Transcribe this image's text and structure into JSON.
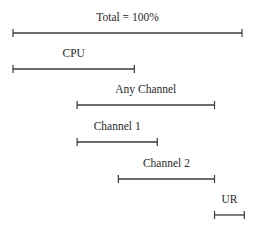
{
  "diagram": {
    "intervals": [
      {
        "id": "total",
        "label": "Total = 100%",
        "start": 0.0,
        "end": 1.0
      },
      {
        "id": "cpu",
        "label": "CPU",
        "start": 0.0,
        "end": 0.53
      },
      {
        "id": "any-channel",
        "label": "Any Channel",
        "start": 0.28,
        "end": 0.88
      },
      {
        "id": "channel-1",
        "label": "Channel 1",
        "start": 0.28,
        "end": 0.63
      },
      {
        "id": "channel-2",
        "label": "Channel 2",
        "start": 0.46,
        "end": 0.88
      },
      {
        "id": "ur",
        "label": "UR",
        "start": 0.88,
        "end": 1.01
      }
    ]
  }
}
